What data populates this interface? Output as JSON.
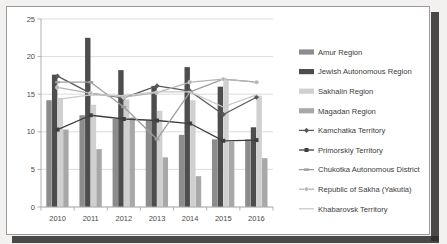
{
  "chart_data": {
    "type": "bar",
    "title": "",
    "subtitle": "",
    "xlabel": "",
    "ylabel": "",
    "categories": [
      "2010",
      "2011",
      "2012",
      "2013",
      "2014",
      "2015",
      "2016"
    ],
    "ylim": [
      0,
      25
    ],
    "yticks": [
      0,
      5,
      10,
      15,
      20,
      25
    ],
    "ytick_labels": [
      "0",
      "5",
      "10",
      "15",
      "20",
      "25"
    ],
    "grid": true,
    "legend_position": "right",
    "bar_series": [
      {
        "name": "Amur Region",
        "color": "#8c8c8c",
        "values": [
          14.2,
          12.2,
          11.7,
          11.5,
          9.6,
          9.0,
          9.0
        ]
      },
      {
        "name": "Jewish Autonomous Region",
        "color": "#4d4d4d",
        "values": [
          17.6,
          22.5,
          18.2,
          16.1,
          18.6,
          16.0,
          10.6
        ]
      },
      {
        "name": "Sakhalin Region",
        "color": "#d0d0d0",
        "values": [
          14.5,
          13.6,
          14.3,
          12.8,
          14.2,
          17.0,
          14.8
        ]
      },
      {
        "name": "Magadan Region",
        "color": "#a8a8a8",
        "values": [
          10.3,
          7.7,
          11.9,
          6.6,
          4.1,
          8.7,
          6.5
        ]
      }
    ],
    "line_series": [
      {
        "name": "Kamchatka Territory",
        "color": "#595959",
        "marker": "diamond",
        "values": [
          17.4,
          15.1,
          14.5,
          16.1,
          15.4,
          12.3,
          14.6
        ]
      },
      {
        "name": "Primorskiy Territory",
        "color": "#3f3f3f",
        "marker": "square",
        "values": [
          10.3,
          12.2,
          11.7,
          11.5,
          11.1,
          8.8,
          8.9
        ]
      },
      {
        "name": "Chukotka Autonomous District",
        "color": "#9e9e9e",
        "marker": "line",
        "values": [
          16.6,
          16.6,
          13.3,
          9.0,
          15.3,
          17.0,
          16.6
        ]
      },
      {
        "name": "Republic of Sakha (Yakutia)",
        "color": "#b5b5b5",
        "marker": "circle",
        "values": [
          15.9,
          15.1,
          14.6,
          15.2,
          16.6,
          17.0,
          16.6
        ]
      },
      {
        "name": "Khabarovsk Territory",
        "color": "#c9c9c9",
        "marker": "none",
        "values": [
          14.3,
          14.9,
          14.8,
          15.3,
          15.3,
          13.3,
          14.9
        ]
      }
    ],
    "colors": {
      "plot_background": "#ffffff",
      "grid": "#d4d4d4",
      "axis": "#b0b0b0",
      "text": "#4a4a4a",
      "page_background": "#f2f1ef",
      "frame_border": "#9a9a9a"
    }
  }
}
